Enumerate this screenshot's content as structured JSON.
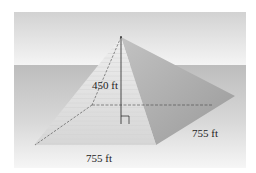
{
  "figure": {
    "labels": {
      "height": "450 ft",
      "base_front": "755 ft",
      "base_side": "755 ft"
    },
    "colors": {
      "sky_top": "#d4d4d4",
      "sky_bottom": "#f4f4f4",
      "ground": "#c4c4c4",
      "ground_bottom": "#f2f2f2",
      "front_face": "#e2e2e2",
      "right_face": "#a8a8a8",
      "edge_line": "#333333"
    },
    "right_angle_marker": true
  }
}
